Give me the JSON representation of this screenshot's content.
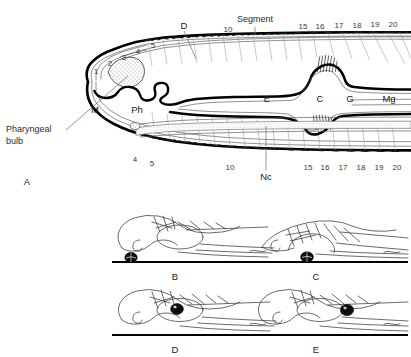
{
  "figure": {
    "caption_panels": [
      "A",
      "B",
      "C",
      "D",
      "E"
    ],
    "background_color": "#ffffff",
    "ink_color": "#000000"
  },
  "panel_a": {
    "label": "A",
    "callouts": [
      {
        "name": "pharyngeal-bulb",
        "text_line1": "Pharyngeal",
        "text_line2": "bulb"
      },
      {
        "name": "segment",
        "text": "Segment"
      },
      {
        "name": "dorsal-vessel",
        "text": "D"
      },
      {
        "name": "nerve-cord",
        "text": "Nc"
      }
    ],
    "organ_labels": [
      {
        "key": "mouth",
        "text": "M"
      },
      {
        "key": "pharynx",
        "text": "Ph"
      },
      {
        "key": "esophagus",
        "text": "E"
      },
      {
        "key": "crop",
        "text": "C"
      },
      {
        "key": "gizzard",
        "text": "G"
      },
      {
        "key": "midgut",
        "text": "Mg"
      }
    ],
    "segment_numbers_top_head": [
      "1",
      "2",
      "3",
      "4",
      "5"
    ],
    "segment_numbers_top_mid": [
      "10"
    ],
    "segment_numbers_top_rear": [
      "15",
      "16",
      "17",
      "18",
      "19",
      "20"
    ],
    "segment_numbers_bottom_head": [
      "4",
      "5"
    ],
    "segment_numbers_bottom_mid": [
      "10"
    ],
    "segment_numbers_bottom_rear": [
      "15",
      "16",
      "17",
      "18",
      "19",
      "20"
    ]
  },
  "panels_bcde": [
    {
      "label": "B",
      "particle_position": "at substrate ahead of mouth",
      "head_posture": "raised, snout arched"
    },
    {
      "label": "C",
      "particle_position": "at mouth on substrate",
      "head_posture": "lowered flat against substrate"
    },
    {
      "label": "D",
      "particle_position": "ingested, within buccal cavity",
      "head_posture": "raised, snout forward"
    },
    {
      "label": "E",
      "particle_position": "passed back into pharynx",
      "head_posture": "raised, snout forward"
    }
  ],
  "colors": {
    "wall": "#000000",
    "septa": "#9a9a9a",
    "stipple": "#b8b8b8",
    "particle": "#0d0d0d",
    "label_text": "#2b2b2b"
  }
}
